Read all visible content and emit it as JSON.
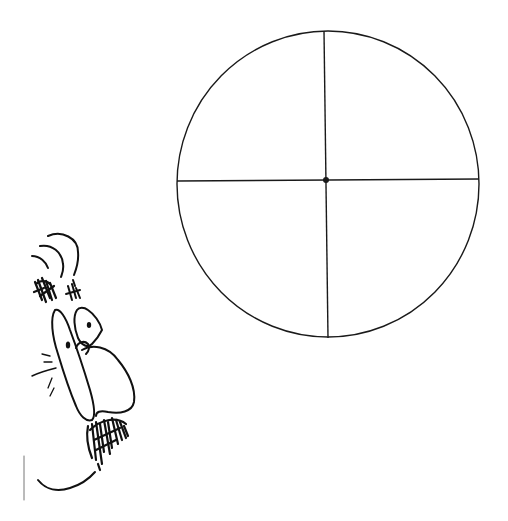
{
  "figure": {
    "background": "#ffffff",
    "stroke_color": "#1a1a1a",
    "quadrant_circle": {
      "cx": 328,
      "cy": 184,
      "rx": 151,
      "ry": 153,
      "center_dot": {
        "x": 326,
        "y": 180,
        "r": 3
      },
      "horizontal_line": {
        "x1": 177,
        "y1": 181,
        "x2": 479,
        "y2": 179
      },
      "vertical_line": {
        "x1": 324,
        "y1": 31,
        "x2": 328,
        "y2": 338
      }
    },
    "face_sketch": {
      "description": "cartoon profile face peeking from lower-left"
    }
  }
}
